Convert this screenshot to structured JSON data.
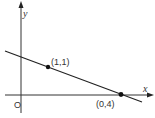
{
  "diagram": {
    "type": "coordinate-plane-line",
    "axes": {
      "x_label": "x",
      "y_label": "y",
      "origin_label": "O"
    },
    "points": [
      {
        "label": "(1,1)",
        "description": "point on line"
      },
      {
        "label": "(0,4)",
        "description": "point where line meets x-axis"
      }
    ],
    "colors": {
      "ink": "#222222",
      "background": "#ffffff"
    }
  }
}
